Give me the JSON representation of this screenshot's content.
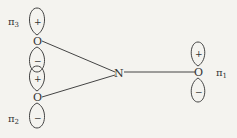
{
  "diagram": {
    "center_atom": "N",
    "oxygens": [
      {
        "id": "top",
        "label": "O",
        "orbital_label": "π",
        "subscript": "3",
        "upper_lobe_sign": "+",
        "lower_lobe_sign": "−"
      },
      {
        "id": "bottom",
        "label": "O",
        "orbital_label": "π",
        "subscript": "2",
        "upper_lobe_sign": "+",
        "lower_lobe_sign": "−"
      },
      {
        "id": "right",
        "label": "O",
        "orbital_label": "π",
        "subscript": "1",
        "upper_lobe_sign": "+",
        "lower_lobe_sign": "−"
      }
    ],
    "colors": {
      "line": "#444444",
      "background": "#f4f3ef"
    }
  }
}
